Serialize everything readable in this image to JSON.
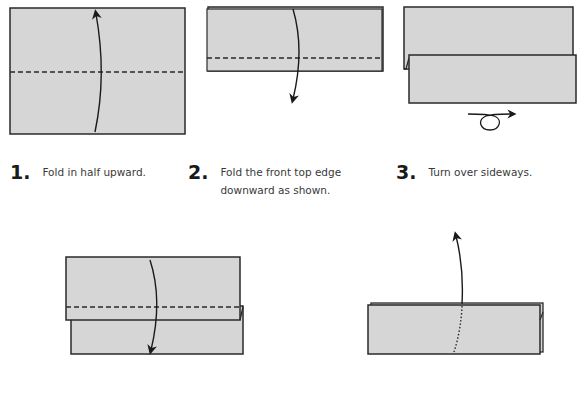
{
  "colors": {
    "paper": "#d6d6d6",
    "outline": "#2a2a2a",
    "background": "#ffffff",
    "text": "#3a3a3a",
    "step_number": "#1a1a1a"
  },
  "steps": [
    {
      "number": "1.",
      "text": "Fold in half upward.",
      "fold_line": "valley (dashed)",
      "arrow": "up"
    },
    {
      "number": "2.",
      "text": "Fold the front top edge downward as shown.",
      "text_line1": "Fold the front top edge",
      "text_line2": "downward as shown.",
      "fold_line": "valley (dashed)",
      "arrow": "down"
    },
    {
      "number": "3.",
      "text": "Turn over sideways.",
      "arrow": "turn-over-icon"
    },
    {
      "number": "",
      "text": "",
      "fold_line": "valley (dashed)",
      "arrow": "down"
    },
    {
      "number": "",
      "text": "",
      "fold_line": "hidden (dotted)",
      "arrow": "up"
    }
  ]
}
